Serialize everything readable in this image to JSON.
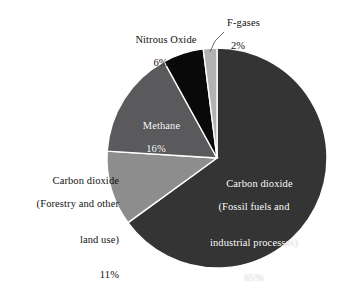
{
  "chart_data": {
    "type": "pie",
    "title": "",
    "subtitle": "",
    "xlabel": "",
    "ylabel": "",
    "legend_position": "none",
    "grid": false,
    "units": "percent",
    "categories": [
      "Carbon dioxide (Fossil fuels and industrial processes)",
      "Carbon dioxide (Forestry and other land use)",
      "Methane",
      "Nitrous Oxide",
      "F-gases"
    ],
    "values": [
      65,
      11,
      16,
      6,
      2
    ],
    "slices": [
      {
        "name": "Carbon dioxide (Fossil fuels and industrial processes)",
        "value": 65,
        "percent_label": "65%",
        "color": "#343434",
        "label_lines": [
          "Carbon dioxide",
          "(Fossil fuels and",
          "industrial processes)"
        ],
        "label_placement": "inside",
        "label_color": "#ffffff",
        "start_angle_deg": 0,
        "end_angle_deg": 234
      },
      {
        "name": "Carbon dioxide (Forestry and other land use)",
        "value": 11,
        "percent_label": "11%",
        "color": "#8d8d8d",
        "label_lines": [
          "Carbon dioxide",
          "(Forestry and other",
          "land use)"
        ],
        "label_placement": "outside-left",
        "label_color": "#111111",
        "start_angle_deg": 234,
        "end_angle_deg": 273.6
      },
      {
        "name": "Methane",
        "value": 16,
        "percent_label": "16%",
        "color": "#5a5a5c",
        "label_lines": [
          "Methane"
        ],
        "label_placement": "inside",
        "label_color": "#ffffff",
        "start_angle_deg": 273.6,
        "end_angle_deg": 331.2
      },
      {
        "name": "Nitrous Oxide",
        "value": 6,
        "percent_label": "6%",
        "color": "#090909",
        "label_lines": [
          "Nitrous Oxide"
        ],
        "label_placement": "outside-top-left",
        "label_color": "#111111",
        "start_angle_deg": 331.2,
        "end_angle_deg": 352.8
      },
      {
        "name": "F-gases",
        "value": 2,
        "percent_label": "2%",
        "color": "#b2b2b2",
        "label_lines": [
          "F-gases"
        ],
        "label_placement": "outside-top-leader",
        "label_color": "#111111",
        "start_angle_deg": 352.8,
        "end_angle_deg": 360
      }
    ]
  },
  "labels": {
    "fgases": {
      "name": "F-gases",
      "percent": "2%"
    },
    "nitrous": {
      "name": "Nitrous Oxide",
      "percent": "6%"
    },
    "methane": {
      "name": "Methane",
      "percent": "16%"
    },
    "forestry": {
      "line1": "Carbon dioxide",
      "line2": "(Forestry and other",
      "line3": "land use)",
      "percent": "11%"
    },
    "fossil": {
      "line1": "Carbon dioxide",
      "line2": "(Fossil fuels and",
      "line3": "industrial processes)",
      "percent": "65%"
    }
  },
  "colors": {
    "background": "#ffffff",
    "fossil_co2": "#343434",
    "forestry_co2": "#8d8d8d",
    "methane": "#5a5a5c",
    "nitrous_oxide": "#090909",
    "fgases": "#b2b2b2",
    "text": "#111111",
    "inside_text": "#ffffff",
    "leader_line": "#6b6b6b"
  }
}
